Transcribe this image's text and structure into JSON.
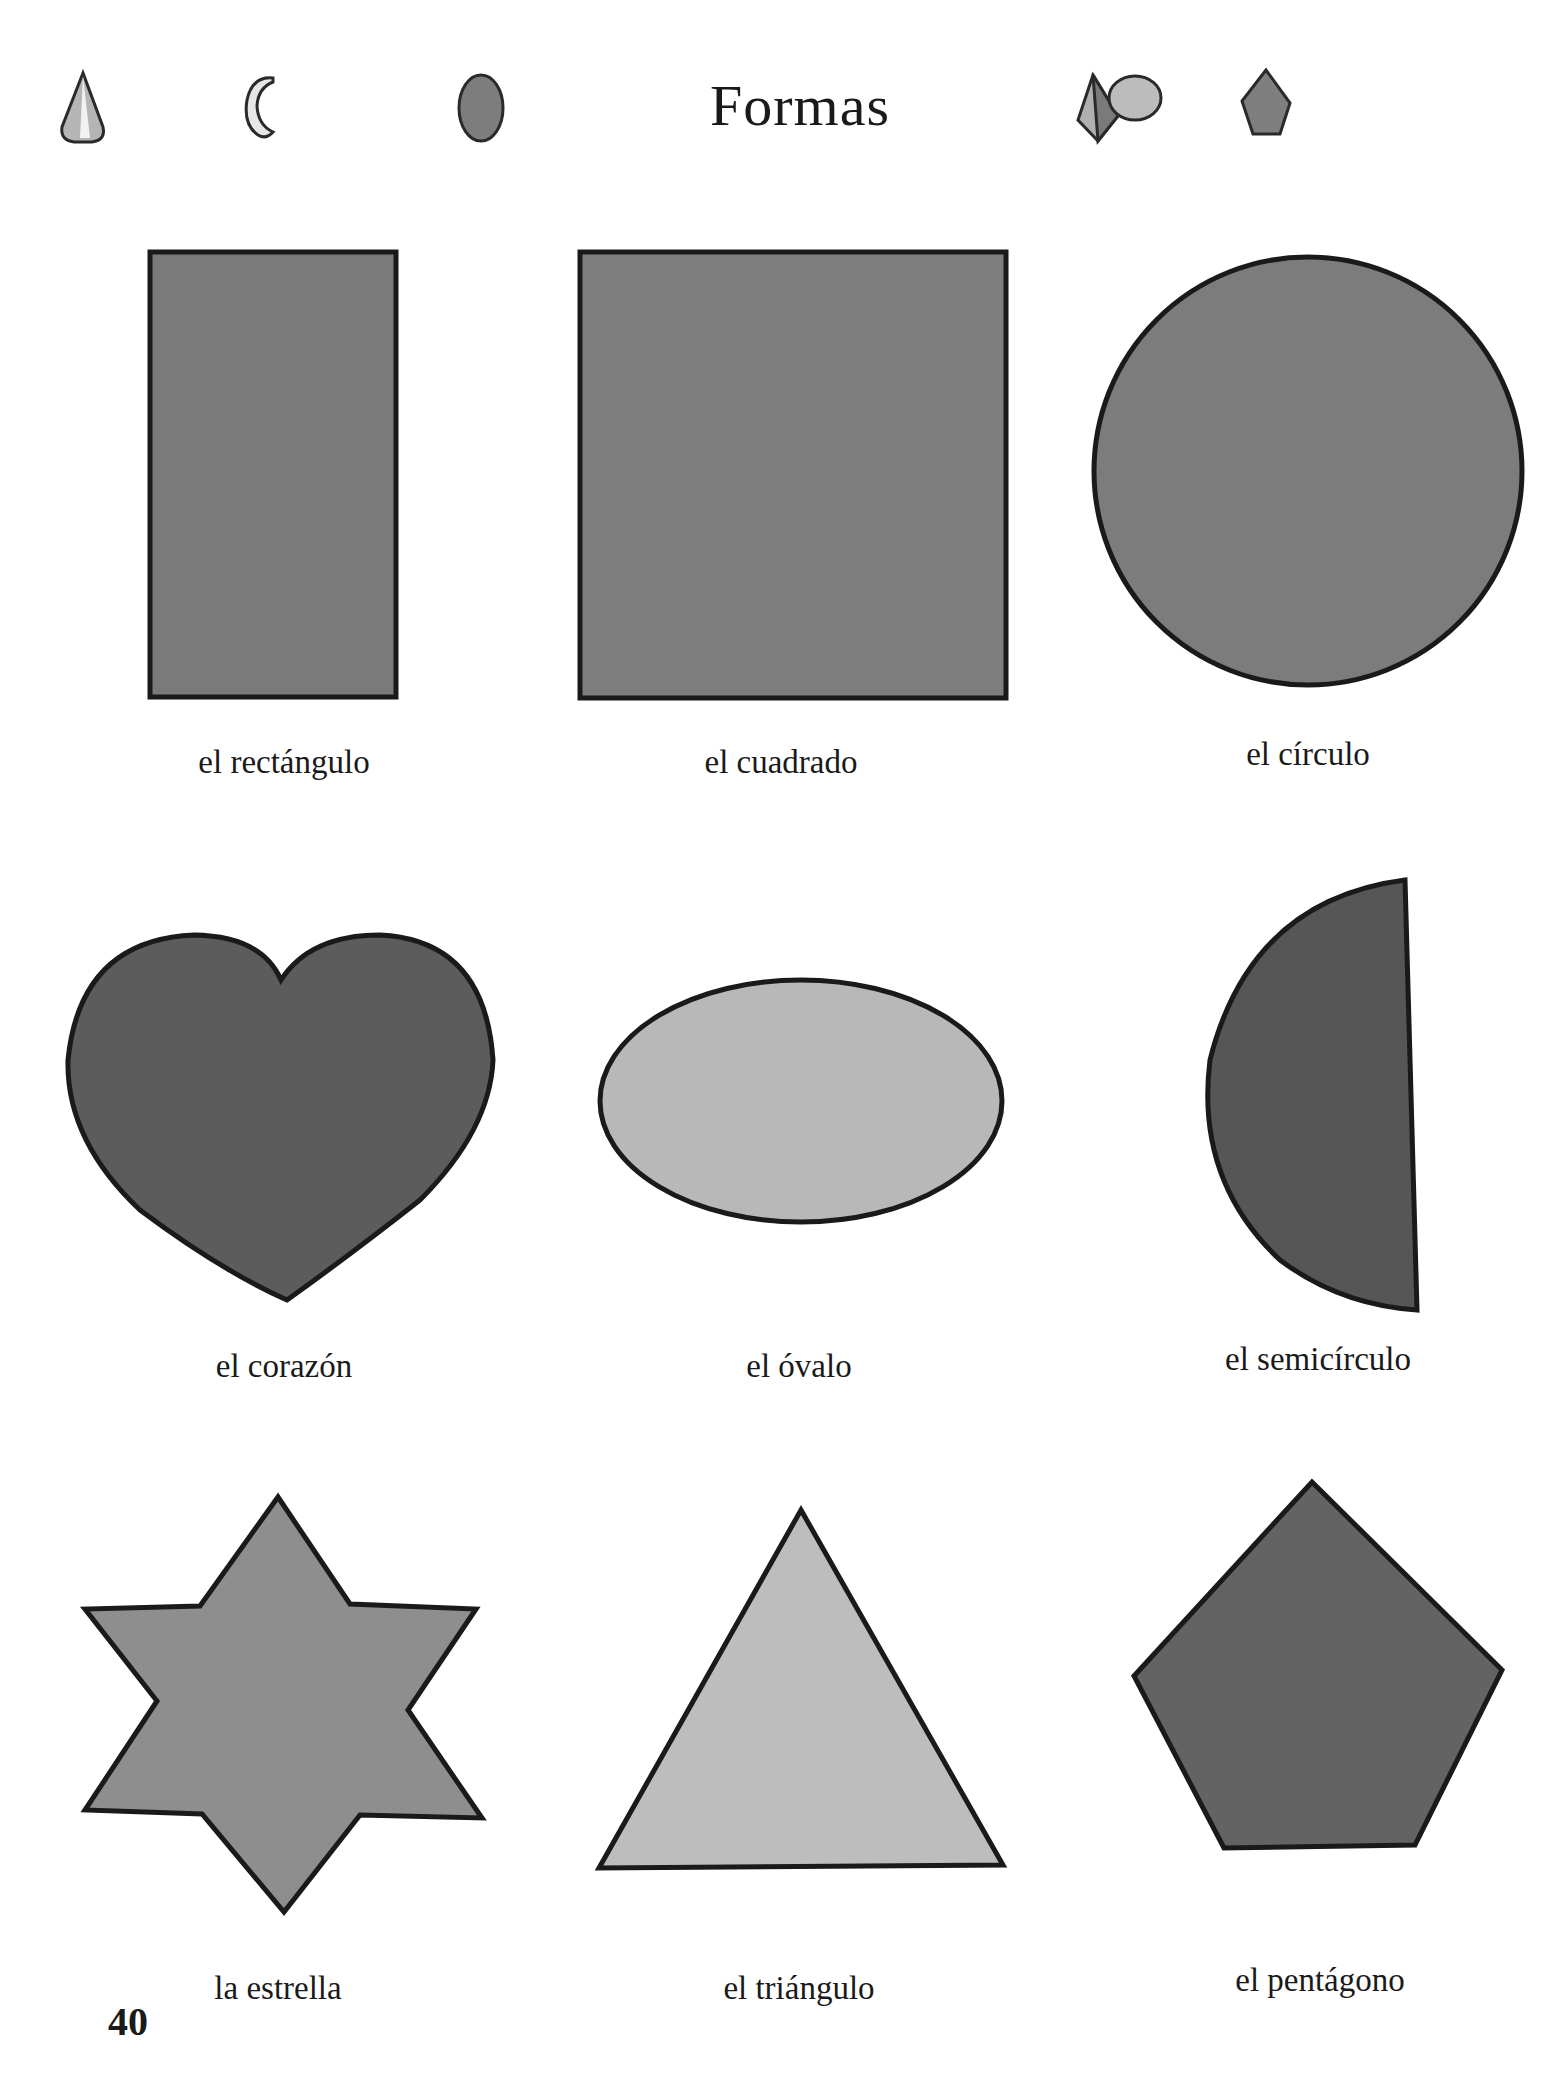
{
  "page": {
    "title": "Formas",
    "page_number": "40"
  },
  "header_icons": [
    {
      "name": "cone-icon"
    },
    {
      "name": "crescent-moon-icon"
    },
    {
      "name": "circle-icon"
    },
    {
      "name": "pyramid-icon"
    },
    {
      "name": "ellipse-icon"
    },
    {
      "name": "pentagon-icon"
    }
  ],
  "shapes": [
    {
      "id": "rectangle",
      "label": "el rectángulo",
      "fill": "#7a7a7a"
    },
    {
      "id": "square",
      "label": "el cuadrado",
      "fill": "#7e7e7e"
    },
    {
      "id": "circle",
      "label": "el círculo",
      "fill": "#7c7c7c"
    },
    {
      "id": "heart",
      "label": "el corazón",
      "fill": "#5c5c5c"
    },
    {
      "id": "oval",
      "label": "el óvalo",
      "fill": "#b8b8b8"
    },
    {
      "id": "semicircle",
      "label": "el semicírculo",
      "fill": "#565656"
    },
    {
      "id": "star",
      "label": "la estrella",
      "fill": "#8e8e8e"
    },
    {
      "id": "triangle",
      "label": "el triángulo",
      "fill": "#bdbdbd"
    },
    {
      "id": "pentagon",
      "label": "el pentágono",
      "fill": "#636363"
    }
  ],
  "colors": {
    "outline": "#1a1a1a",
    "background": "#ffffff"
  }
}
